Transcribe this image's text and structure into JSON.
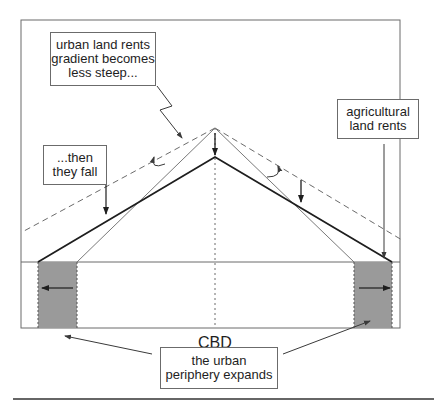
{
  "diagram": {
    "labels": {
      "gradient_box": [
        "urban land rents",
        "gradient becomes",
        "less steep..."
      ],
      "fall_box": [
        "...then",
        "they fall"
      ],
      "agri_box": [
        "agricultural",
        "land rents"
      ],
      "cbd": "CBD",
      "periphery_box": [
        "the urban",
        "periphery expands"
      ]
    },
    "colors": {
      "frame": "#6b6b6b",
      "thick_line": "#1e1e1e",
      "thin_line": "#7a7a7a",
      "dashed_line": "#6b6b6b",
      "periphery_fill": "#9a9a9a",
      "arrow": "#1e1e1e"
    },
    "elements": {
      "old_gradient": "thin line, peak at CBD higher, steeper slope",
      "new_gradient": "thick line, peak lower, less steep, reaches further",
      "dashed_reference": "dashed line showing slope change",
      "periphery_expansion": "shaded bands on both sides with outward arrows"
    }
  }
}
